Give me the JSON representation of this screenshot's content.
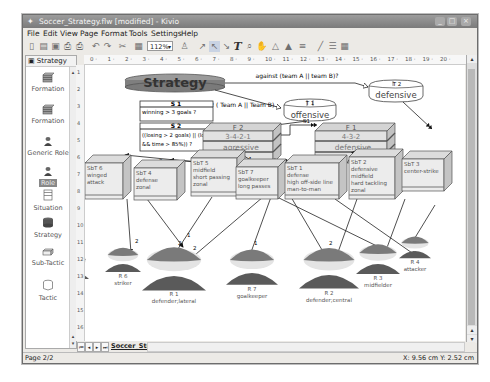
{
  "window": {
    "title": "Soccer_Strategy.flw [modified] - Kivio",
    "controls": [
      "_",
      "□",
      "×"
    ]
  },
  "menu": [
    "File",
    "Edit",
    "View",
    "Page",
    "Format",
    "Tools",
    "Settings",
    "Help"
  ],
  "toolbar": {
    "zoom_value": "112%"
  },
  "ruler": {
    "horizontal_ticks": [
      "0",
      "1",
      "2",
      "3",
      "4",
      "5",
      "6",
      "7",
      "8",
      "9",
      "10",
      "11",
      "12",
      "13",
      "14",
      "15",
      "16",
      "17",
      "18",
      "19",
      "20"
    ],
    "vertical_ticks": [
      "1",
      "2",
      "3",
      "4",
      "5",
      "6",
      "7",
      "8",
      "9",
      "10",
      "11",
      "12",
      "13",
      "14",
      "15",
      "16"
    ]
  },
  "sidebar": {
    "header": "Strategy",
    "items": [
      {
        "label": "Formation",
        "icon": "formation-icon"
      },
      {
        "label": "Formation",
        "icon": "formation-icon"
      },
      {
        "label": "Generic Role",
        "icon": "generic-role-icon"
      },
      {
        "label": "Role",
        "icon": "role-icon"
      },
      {
        "label": "Situation",
        "icon": "situation-icon"
      },
      {
        "label": "Strategy",
        "icon": "strategy-icon"
      },
      {
        "label": "Sub-Tactic",
        "icon": "sub-tactic-icon"
      },
      {
        "label": "Tactic",
        "icon": "tactic-icon"
      }
    ]
  },
  "diagram": {
    "strategy": {
      "label": "Strategy"
    },
    "condition_top": "against (team A || team B)?",
    "condition_left": "! ( Team A || Team B)",
    "tactics": [
      {
        "id": "T 1",
        "label": "offensive"
      },
      {
        "id": "T 2",
        "label": "defensive"
      }
    ],
    "situations": [
      {
        "id": "S 1",
        "text": "winning > 3 goals ?"
      },
      {
        "id": "S 2",
        "text": "((losing > 2 goals) || (losing && time > 85%)) ?"
      }
    ],
    "formations": [
      {
        "id": "F 2",
        "scheme": "3-4-2-1",
        "style": "agressive"
      },
      {
        "id": "F 1",
        "scheme": "4-3-2",
        "style": "defensive"
      }
    ],
    "transitions": [
      "S1",
      "S2"
    ],
    "subtactics": [
      {
        "id": "SbT 6",
        "lines": [
          "winged",
          "attack"
        ]
      },
      {
        "id": "SbT 4",
        "lines": [
          "defense",
          "zonal"
        ]
      },
      {
        "id": "SbT 5",
        "lines": [
          "midfield",
          "short passing",
          "zonal"
        ]
      },
      {
        "id": "SbT 7",
        "lines": [
          "goalkeeper",
          "long passes"
        ]
      },
      {
        "id": "SbT 1",
        "lines": [
          "defense",
          "high off-side line",
          "man-to-man"
        ]
      },
      {
        "id": "SbT 2",
        "lines": [
          "defensive",
          "midfield",
          "hard tackling",
          "zonal"
        ]
      },
      {
        "id": "SbT 3",
        "lines": [
          "center-strike"
        ]
      }
    ],
    "roles": [
      {
        "id": "R 5",
        "name": "winger"
      },
      {
        "id": "R 6",
        "name": "striker"
      },
      {
        "id": "R 1",
        "name": "defender;lateral"
      },
      {
        "id": "R 7",
        "name": "goalkeeper"
      },
      {
        "id": "R 2",
        "name": "defender;central"
      },
      {
        "id": "R 3",
        "name": "midfielder"
      },
      {
        "id": "R 4",
        "name": "attacker"
      }
    ],
    "edge_labels_formation": [
      "3",
      "3",
      "4",
      "1",
      "1",
      "4",
      "3",
      "3"
    ],
    "edge_labels_roles": [
      "2",
      "1",
      "2",
      "2",
      "1",
      "2"
    ],
    "colors": {
      "strategy_fill": "#8a8a8a",
      "role_head": "#7a7a7a",
      "role_body": "#5a5a5a",
      "box_fill": "#e6e6e6"
    }
  },
  "tabs": {
    "active": "Soccer_Strategy"
  },
  "status": {
    "page": "Page 2/2",
    "coords": "X: 9.56 cm  Y: 2.52 cm"
  }
}
